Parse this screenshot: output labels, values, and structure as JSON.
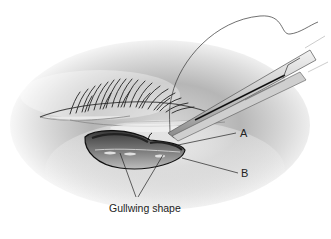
{
  "figure": {
    "type": "surgical-illustration",
    "labels": {
      "a": "A",
      "b": "B",
      "gullwing": "Gullwing shape"
    },
    "colors": {
      "background": "#ffffff",
      "skin_shadow": "#7a7a7a",
      "line": "#1a1a1a",
      "instrument": "#d8d8d8"
    }
  }
}
